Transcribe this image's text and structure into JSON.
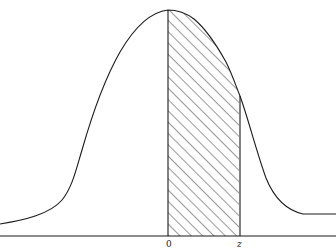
{
  "figure": {
    "labels": {
      "zero": "0",
      "z": "z"
    },
    "colors": {
      "line": "#1a1a1a",
      "background": "#ffffff"
    },
    "shaded_region": {
      "from": "0",
      "to": "z",
      "pattern": "diagonal-hatch"
    }
  }
}
